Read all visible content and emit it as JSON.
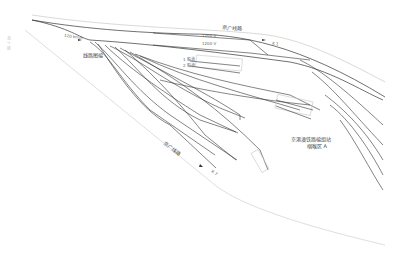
{
  "diagram": {
    "type": "railway-track-layout",
    "labels": {
      "side_vertical": "北 ↑ 区",
      "left_track_speed": "120 km/h",
      "yard_name": "线路图编",
      "top_line_name": "京广线路",
      "top_speed_1": "1200 V",
      "top_speed_2": "1200 V",
      "top_right_marker": "K 1",
      "siding_1": "1 股道",
      "siding_2": "2 股道",
      "bottom_line_name": "京广线路",
      "bottom_marker": "K 7",
      "station_name_line1": "京港澳铁路编组站",
      "station_name_line2": "咽喉区 A"
    },
    "colors": {
      "track": "#333333",
      "boundary": "#cccccc",
      "platform": "#bbbbbb",
      "text": "#444444"
    }
  }
}
